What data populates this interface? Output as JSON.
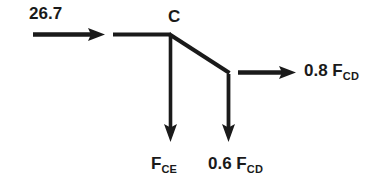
{
  "diagram": {
    "type": "free-body-diagram",
    "background_color": "#ffffff",
    "stroke_color": "#1a1a1a",
    "text_color": "#1a1a1a",
    "joints": [
      {
        "name": "C",
        "label": "C",
        "x": 170,
        "y": 34
      },
      {
        "name": "lower-node",
        "label": "",
        "x": 228,
        "y": 72
      }
    ],
    "members": [
      {
        "name": "horizontal-member-left",
        "from_x": 113,
        "from_y": 34,
        "to_x": 170,
        "to_y": 34
      },
      {
        "name": "diagonal-member-right",
        "from_x": 170,
        "from_y": 34,
        "to_x": 229,
        "to_y": 73
      }
    ],
    "forces": [
      {
        "name": "applied-force-left",
        "label": "26.7",
        "value": "26.7",
        "direction": "right",
        "tail_x": 33,
        "tail_y": 34,
        "tip_x": 105,
        "tip_y": 34
      },
      {
        "name": "force-cd-horizontal",
        "label_prefix": "0.8 F",
        "label_subscript": "CD",
        "value": "0.8 F_CD",
        "direction": "right",
        "tail_x": 238,
        "tail_y": 72,
        "tip_x": 296,
        "tip_y": 72
      },
      {
        "name": "force-ce-vertical",
        "label_prefix": "F",
        "label_subscript": "CE",
        "value": "F_CE",
        "direction": "down",
        "tail_x": 170,
        "tail_y": 36,
        "tip_x": 170,
        "tip_y": 142
      },
      {
        "name": "force-cd-vertical",
        "label_prefix": "0.6 F",
        "label_subscript": "CD",
        "value": "0.6 F_CD",
        "direction": "down",
        "tail_x": 228,
        "tail_y": 74,
        "tip_x": 228,
        "tip_y": 142
      }
    ]
  }
}
